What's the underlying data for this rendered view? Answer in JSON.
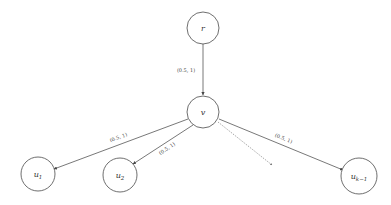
{
  "diagram": {
    "nodes": [
      {
        "id": "r",
        "label": "r",
        "sub": ""
      },
      {
        "id": "v",
        "label": "v",
        "sub": ""
      },
      {
        "id": "u1",
        "label": "u",
        "sub": "1"
      },
      {
        "id": "u2",
        "label": "u",
        "sub": "2"
      },
      {
        "id": "uk1",
        "label": "u",
        "sub": "k−1"
      }
    ],
    "edges": [
      {
        "from": "r",
        "to": "v",
        "label": "(0.5, 1)",
        "style": "solid"
      },
      {
        "from": "v",
        "to": "u1",
        "label": "(0.5, 1)",
        "style": "solid"
      },
      {
        "from": "v",
        "to": "u2",
        "label": "(0.5, 1)",
        "style": "solid"
      },
      {
        "from": "v",
        "to": "ellipsis",
        "label": "",
        "style": "dotted"
      },
      {
        "from": "v",
        "to": "uk1",
        "label": "(0.5, 1)",
        "style": "solid"
      }
    ]
  }
}
